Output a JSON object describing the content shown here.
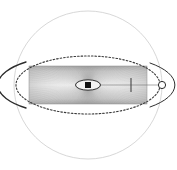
{
  "figure": {
    "canvas": {
      "width": 177,
      "height": 170,
      "background": "#ffffff"
    },
    "center": {
      "x": 88,
      "y": 85
    },
    "elements": {
      "outer_sphere": {
        "name": "outer sphere",
        "shape": "circle",
        "cx": 88,
        "cy": 85,
        "r": 74,
        "stroke": "#c9c9c9",
        "stroke_width": 0.8,
        "fill": "none",
        "dashed": false
      },
      "equatorial_ellipse": {
        "name": "equatorial orbit ellipse",
        "shape": "ellipse",
        "cx": 88,
        "cy": 85,
        "rx": 72,
        "ry": 29,
        "stroke": "#3a3a3a",
        "stroke_width": 1.1,
        "fill": "none",
        "dashed": true,
        "dash_pattern": "1.6 1.9"
      },
      "ellipse_left_cusp": {
        "name": "left cusp arc",
        "shape": "arc",
        "stroke": "#2b2b2b",
        "stroke_width": 1.3
      },
      "ellipse_right_cusp": {
        "name": "right cusp arc",
        "shape": "arc",
        "stroke": "#2b2b2b",
        "stroke_width": 1.1
      },
      "disk_rectangle": {
        "name": "disk slab",
        "shape": "rect",
        "x": 29,
        "y": 66,
        "width": 118,
        "height": 38,
        "fill_light": "#fafafa",
        "fill_mid": "#d4d4d4",
        "fill_edge": "#9e9e9e",
        "stroke": "#8d8d8d",
        "stroke_width": 0.5
      },
      "radial_rays": {
        "name": "radial ray bundle",
        "count": 150,
        "stroke": "#8a8a8a",
        "stroke_width": 0.35,
        "origin_x": 88,
        "origin_y": 85
      },
      "central_ellipse": {
        "name": "central compact ellipse",
        "shape": "ellipse",
        "cx": 88,
        "cy": 85,
        "rx": 12.5,
        "ry": 5.2,
        "stroke": "#2e2e2e",
        "stroke_width": 1.0,
        "fill": "#f2f2f2"
      },
      "central_square": {
        "name": "central black square",
        "shape": "rect",
        "x": 85,
        "y": 82,
        "width": 6,
        "height": 6,
        "fill": "#111111"
      },
      "axis_line": {
        "name": "equatorial axis line",
        "shape": "line",
        "x1": 100,
        "y1": 85,
        "x2": 164,
        "y2": 85,
        "stroke": "#6f6f6f",
        "stroke_width": 0.6
      },
      "tick_mark": {
        "name": "radius tick",
        "shape": "line",
        "x": 131,
        "y1": 78,
        "y2": 92,
        "stroke": "#444444",
        "stroke_width": 1.0
      },
      "right_node_circle": {
        "name": "right vertex node",
        "shape": "circle",
        "cx": 162,
        "cy": 85,
        "r": 3.6,
        "stroke": "#2b2b2b",
        "stroke_width": 1.0,
        "fill": "#ffffff"
      }
    },
    "labels": {
      "title_text": "",
      "caption_text": "",
      "axis_label": "",
      "legend": []
    }
  },
  "chart_data": {
    "type": "scatter",
    "title": "",
    "xlabel": "",
    "ylabel": "",
    "grid": false,
    "legend_position": "none",
    "xlim": [
      -1.0,
      1.0
    ],
    "ylim": [
      -1.0,
      1.0
    ],
    "annotations": [],
    "series": [
      {
        "name": "outer sphere boundary",
        "geometry": "circle",
        "center": [
          0,
          0
        ],
        "radius": 1.0,
        "style": "solid thin light-gray"
      },
      {
        "name": "equatorial orbit",
        "geometry": "ellipse",
        "center": [
          0,
          0
        ],
        "semi_major": 0.973,
        "semi_minor": 0.392,
        "style": "dotted dark-gray"
      },
      {
        "name": "accretion disk slab",
        "geometry": "rectangle",
        "x_range": [
          -0.797,
          0.797
        ],
        "y_range": [
          -0.257,
          0.257
        ],
        "style": "gray gradient fill with radial rays"
      },
      {
        "name": "central object",
        "geometry": "ellipse",
        "center": [
          0,
          0
        ],
        "semi_major": 0.169,
        "semi_minor": 0.07,
        "style": "solid outline, light fill, black square core"
      },
      {
        "name": "marker node",
        "geometry": "point",
        "position": [
          1.0,
          0
        ],
        "style": "open circle"
      },
      {
        "name": "radius tick",
        "geometry": "point",
        "position": [
          0.581,
          0
        ],
        "style": "vertical bar"
      }
    ]
  }
}
